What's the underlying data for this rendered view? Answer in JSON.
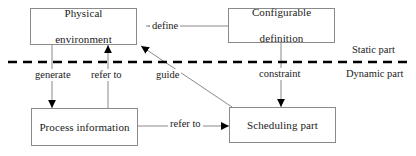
{
  "diagram": {
    "type": "block-flow-diagram",
    "nodes": [
      {
        "id": "physical",
        "label": "Physical environment",
        "line1": "Physical",
        "line2": "environment"
      },
      {
        "id": "configurable",
        "label": "Configurable definition",
        "line1": "Configurable",
        "line2": "definition"
      },
      {
        "id": "process",
        "label": "Process information",
        "line1": "Process information",
        "line2": ""
      },
      {
        "id": "scheduling",
        "label": "Scheduling part",
        "line1": "Scheduling part",
        "line2": ""
      }
    ],
    "edges": [
      {
        "id": "define",
        "label": "define",
        "from": "configurable",
        "to": "physical",
        "direction": "left"
      },
      {
        "id": "generate",
        "label": "generate",
        "from": "physical",
        "to": "process",
        "direction": "down"
      },
      {
        "id": "refer-to-up",
        "label": "refer to",
        "from": "process",
        "to": "physical",
        "direction": "up"
      },
      {
        "id": "guide",
        "label": "guide",
        "from": "scheduling",
        "to": "physical",
        "direction": "up-left"
      },
      {
        "id": "constraint",
        "label": "constraint",
        "from": "configurable",
        "to": "scheduling",
        "direction": "down"
      },
      {
        "id": "refer-to-right",
        "label": "refer to",
        "from": "process",
        "to": "scheduling",
        "direction": "right"
      }
    ],
    "partitions": {
      "divider": "dashed-horizontal",
      "above_label": "Static part",
      "below_label": "Dynamic part"
    },
    "colors": {
      "background": "#ffffff",
      "box_border": "#8a8a8a",
      "connector": "#8a8a8a",
      "arrowhead": "#000000",
      "divider": "#000000",
      "text": "#1a1a1a"
    }
  }
}
